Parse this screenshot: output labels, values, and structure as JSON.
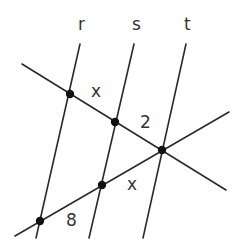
{
  "diagram": {
    "type": "parallel-lines-transversals",
    "lines": {
      "r": {
        "label": "r",
        "x1": 80,
        "y1": 44,
        "x2": 36,
        "y2": 238
      },
      "s": {
        "label": "s",
        "x1": 134,
        "y1": 44,
        "x2": 89,
        "y2": 238
      },
      "t": {
        "label": "t",
        "x1": 186,
        "y1": 44,
        "x2": 143,
        "y2": 238
      }
    },
    "transversals": [
      {
        "name": "upper",
        "x1": 22,
        "y1": 64,
        "x2": 226,
        "y2": 190
      },
      {
        "name": "lower",
        "x1": 15,
        "y1": 236,
        "x2": 229,
        "y2": 112
      }
    ],
    "points": [
      {
        "x": 70,
        "y": 94
      },
      {
        "x": 115,
        "y": 122
      },
      {
        "x": 162,
        "y": 150
      },
      {
        "x": 102,
        "y": 185
      },
      {
        "x": 40,
        "y": 221
      }
    ],
    "line_labels": [
      {
        "text": "r",
        "x": 78,
        "y": 30
      },
      {
        "text": "s",
        "x": 132,
        "y": 30
      },
      {
        "text": "t",
        "x": 184,
        "y": 30
      }
    ],
    "segment_labels": [
      {
        "text": "x",
        "x": 91,
        "y": 97,
        "segment": "upper r-s"
      },
      {
        "text": "2",
        "x": 140,
        "y": 128,
        "segment": "upper s-t"
      },
      {
        "text": "x",
        "x": 127,
        "y": 190,
        "segment": "lower s-t"
      },
      {
        "text": "8",
        "x": 66,
        "y": 226,
        "segment": "lower r-s"
      }
    ]
  }
}
